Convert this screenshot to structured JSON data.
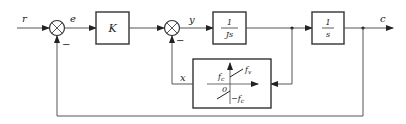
{
  "diagram": {
    "type": "control-system-block-diagram",
    "signals": {
      "input": "r",
      "error": "e",
      "inner": "y",
      "feedback_nonlinear": "x",
      "output": "c"
    },
    "summing_junctions": [
      {
        "id": "sum1",
        "feedback_sign": "−"
      },
      {
        "id": "sum2",
        "feedback_sign": "−"
      }
    ],
    "blocks": {
      "gain": {
        "label": "K"
      },
      "inertia": {
        "numerator": "1",
        "denominator": "Js"
      },
      "integrator": {
        "numerator": "1",
        "denominator": "s"
      },
      "friction": {
        "upper_label": "f_c",
        "upper_label_main": "f",
        "upper_label_sub": "c",
        "slope_label_main": "f",
        "slope_label_sub": "v",
        "origin_label": "0",
        "lower_label_prefix": "−",
        "lower_label_main": "f",
        "lower_label_sub": "c"
      }
    }
  }
}
